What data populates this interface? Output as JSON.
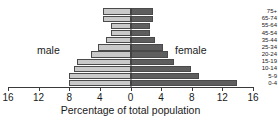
{
  "chart_data": {
    "type": "bar",
    "subtype": "population-pyramid",
    "title": "",
    "xlabel": "Percentage of total population",
    "ylabel": "",
    "categories": [
      "75+",
      "65-74",
      "55-64",
      "45-54",
      "35-44",
      "25-34",
      "20-24",
      "15-19",
      "10-14",
      "5-9",
      "0-4"
    ],
    "series": [
      {
        "name": "male",
        "direction": "left",
        "color": "#c9c9c9",
        "values": [
          8.0,
          8.0,
          7.4,
          7.0,
          5.2,
          4.3,
          3.2,
          2.6,
          2.6,
          3.6,
          3.6
        ]
      },
      {
        "name": "female",
        "direction": "right",
        "color": "#5e5e5e",
        "values": [
          13.9,
          9.0,
          7.9,
          5.7,
          4.9,
          4.2,
          3.2,
          2.6,
          2.6,
          3.0,
          3.0
        ]
      }
    ],
    "xlim": [
      -16,
      16
    ],
    "xticks": [
      -16,
      -12,
      -8,
      -4,
      0,
      4,
      8,
      12,
      16
    ],
    "xtick_labels": [
      "16",
      "12",
      "8",
      "4",
      "0",
      "4",
      "8",
      "12",
      "16"
    ],
    "grid": false,
    "legend": "inline-annotations"
  },
  "annotations": {
    "male_label": "male",
    "female_label": "female"
  },
  "axis": {
    "x_title": "Percentage of total population"
  },
  "colors": {
    "male_bar": "#c9c9c9",
    "female_bar": "#5e5e5e",
    "axis": "#3a3a3a",
    "text": "#1a1a1a",
    "background": "#ffffff"
  }
}
